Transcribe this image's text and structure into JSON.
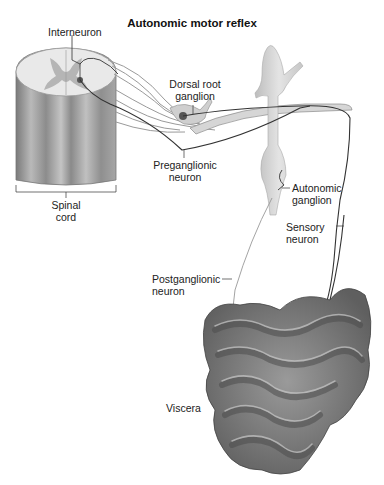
{
  "title": "Autonomic motor reflex",
  "labels": {
    "interneuron": "Interneuron",
    "dorsal_root_ganglion_1": "Dorsal root",
    "dorsal_root_ganglion_2": "ganglion",
    "preganglionic_1": "Preganglionic",
    "preganglionic_2": "neuron",
    "spinal_cord_1": "Spinal",
    "spinal_cord_2": "cord",
    "autonomic_ganglion_1": "Autonomic",
    "autonomic_ganglion_2": "ganglion",
    "sensory_1": "Sensory",
    "sensory_2": "neuron",
    "postganglionic_1": "Postganglionic",
    "postganglionic_2": "neuron",
    "viscera": "Viscera"
  },
  "colors": {
    "tissue_gray": "#a8a8a8",
    "dark_gray": "#6e6e6e",
    "neuron_line": "#333333"
  }
}
